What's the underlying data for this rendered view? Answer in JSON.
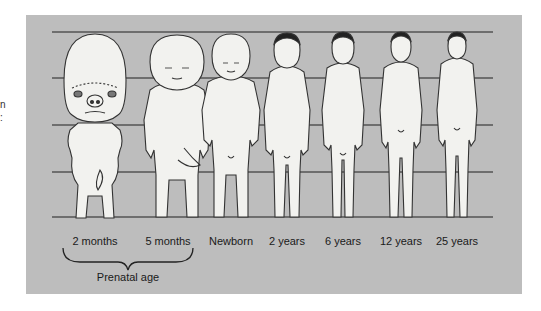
{
  "figure": {
    "type": "proportion-diagram",
    "colors": {
      "background": "#bdbdbd",
      "guide_lines": "#555555",
      "figure_fill": "#f2f2ef",
      "figure_outline": "#333333",
      "text": "#1a1a1a"
    },
    "guide_lines_count": 5,
    "stages": [
      {
        "label": "2 months",
        "center_x": 95
      },
      {
        "label": "5 months",
        "center_x": 177
      },
      {
        "label": "Newborn",
        "center_x": 231
      },
      {
        "label": "2 years",
        "center_x": 287
      },
      {
        "label": "6 years",
        "center_x": 343
      },
      {
        "label": "12 years",
        "center_x": 401
      },
      {
        "label": "25 years",
        "center_x": 457
      }
    ],
    "group": {
      "label": "Prenatal age",
      "spans": [
        "2 months",
        "5 months"
      ]
    },
    "edge_text": "n\n:"
  }
}
